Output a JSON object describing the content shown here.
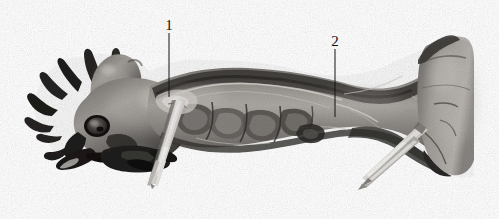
{
  "figure": {
    "type": "anatomical-photograph",
    "background_color": "#ffffff",
    "width": 499,
    "height": 219,
    "color_mode": "grayscale"
  },
  "callouts": [
    {
      "id": "callout-1",
      "label": "1",
      "label_x": 169,
      "label_y": 18,
      "leader_x": 169,
      "leader_top": 33,
      "leader_bottom": 97,
      "color": "#141414"
    },
    {
      "id": "callout-2",
      "label": "2",
      "label_x": 335,
      "label_y": 34,
      "leader_x": 335,
      "leader_top": 49,
      "leader_bottom": 117,
      "color": "#141414"
    }
  ],
  "instruments": [
    {
      "name": "forceps-left",
      "description": "surgical forceps tip angled down-left beneath the cervical region"
    },
    {
      "name": "forceps-right",
      "description": "surgical forceps tips angled down-left at the base of the neck"
    }
  ],
  "palette": {
    "white": "#ffffff",
    "highlight": "#e8e6e2",
    "light_tissue": "#c9c6c1",
    "mid_tissue": "#9a9792",
    "dark_tissue": "#6d6a66",
    "deep_shadow": "#3a3835",
    "black": "#151413",
    "metal_light": "#efeeec",
    "metal_mid": "#b9b7b3",
    "metal_dark": "#74726e",
    "label_ink": "#141414"
  }
}
